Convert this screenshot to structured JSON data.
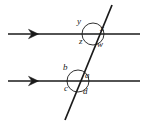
{
  "figure": {
    "kind": "geometry-diagram",
    "stroke_color": "#1a1a1a",
    "background_color": "#ffffff",
    "parallel_lines": [
      {
        "name": "top-parallel-line",
        "x1": 8,
        "y1": 34,
        "x2": 140,
        "y2": 34,
        "arrow_marker": {
          "name": "right-arrowhead",
          "x": 36,
          "y": 34,
          "direction": "right"
        }
      },
      {
        "name": "bottom-parallel-line",
        "x1": 8,
        "y1": 81,
        "x2": 140,
        "y2": 81,
        "arrow_marker": {
          "name": "right-arrowhead",
          "x": 36,
          "y": 81,
          "direction": "right"
        }
      }
    ],
    "transversal": {
      "name": "transversal-line",
      "x1": 112,
      "y1": 5,
      "x2": 65,
      "y2": 120
    },
    "intersections": [
      {
        "name": "upper-intersection",
        "cx": 93,
        "cy": 34,
        "arc_radius": 11,
        "angles": [
          {
            "id": "y",
            "label": "y",
            "position": "upper-left"
          },
          {
            "id": "x",
            "label": "x",
            "position": "upper-right"
          },
          {
            "id": "z",
            "label": "z",
            "position": "lower-left"
          },
          {
            "id": "w",
            "label": "w",
            "position": "lower-right"
          }
        ]
      },
      {
        "name": "lower-intersection",
        "cx": 78,
        "cy": 81,
        "arc_radius": 11,
        "angles": [
          {
            "id": "b",
            "label": "b",
            "position": "upper-left"
          },
          {
            "id": "a",
            "label": "a",
            "position": "upper-right"
          },
          {
            "id": "c",
            "label": "c",
            "position": "lower-left"
          },
          {
            "id": "d",
            "label": "d",
            "position": "lower-right"
          }
        ]
      }
    ]
  }
}
